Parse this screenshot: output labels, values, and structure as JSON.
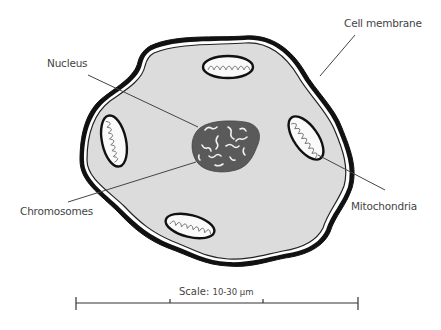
{
  "diagram": {
    "labels": {
      "nucleus": "Nucleus",
      "cell_membrane": "Cell membrane",
      "chromosomes": "Chromosomes",
      "mitochondria": "Mitochondria"
    },
    "scale": {
      "prefix": "Scale:",
      "value": "10-30 μm"
    },
    "colors": {
      "cytoplasm": "#dcdcdc",
      "nucleus": "#5a5a5a",
      "outline": "#111111",
      "leader_line": "#444444",
      "text": "#444444"
    }
  }
}
